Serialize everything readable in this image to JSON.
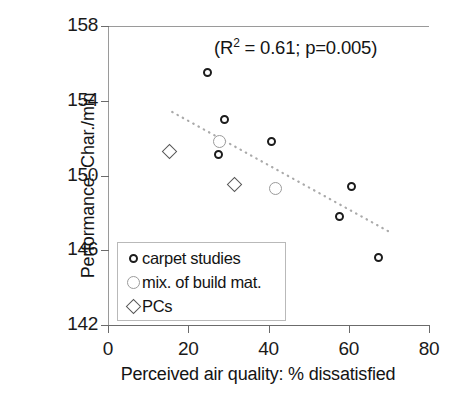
{
  "chart_data": {
    "type": "scatter",
    "title": "",
    "xlabel": "Perceived air quality: % dissatisfied",
    "ylabel": "Performance: Char./min",
    "xlim": [
      0,
      80
    ],
    "ylim": [
      142,
      158
    ],
    "xticks": [
      "0",
      "20",
      "40",
      "60",
      "80"
    ],
    "yticks": [
      "142",
      "146",
      "150",
      "154",
      "158"
    ],
    "grid": false,
    "legend_position": "inside-lower-left",
    "annotation": {
      "prefix": "(R",
      "sup": "2",
      "suffix": " = 0.61; p=0.005)",
      "r_squared": 0.61,
      "p_value": 0.005
    },
    "series": [
      {
        "name": "carpet studies",
        "marker": "circle-small-dark",
        "color": "#1c1c1c",
        "points": [
          {
            "x": 24.8,
            "y": 155.5
          },
          {
            "x": 29.0,
            "y": 153.0
          },
          {
            "x": 27.5,
            "y": 151.1
          },
          {
            "x": 40.8,
            "y": 151.8
          },
          {
            "x": 60.6,
            "y": 149.4
          },
          {
            "x": 57.8,
            "y": 147.8
          },
          {
            "x": 67.3,
            "y": 145.6
          }
        ]
      },
      {
        "name": "mix. of build mat.",
        "marker": "circle-large-gray",
        "color": "#9b9b9b",
        "points": [
          {
            "x": 27.8,
            "y": 151.8
          },
          {
            "x": 41.8,
            "y": 149.3
          }
        ]
      },
      {
        "name": "PCs",
        "marker": "diamond",
        "color": "#585858",
        "points": [
          {
            "x": 15.3,
            "y": 151.3
          },
          {
            "x": 31.5,
            "y": 149.5
          }
        ]
      }
    ],
    "trendline": {
      "style": "dotted",
      "color": "#aaaaaa",
      "x_start": 16.0,
      "y_start": 153.4,
      "x_end": 70.0,
      "y_end": 147.0
    }
  },
  "legend": {
    "items": [
      {
        "label": "carpet studies",
        "key": "circle-small-dark"
      },
      {
        "label": "mix. of build mat.",
        "key": "circle-large-gray"
      },
      {
        "label": "PCs",
        "key": "diamond"
      }
    ]
  }
}
